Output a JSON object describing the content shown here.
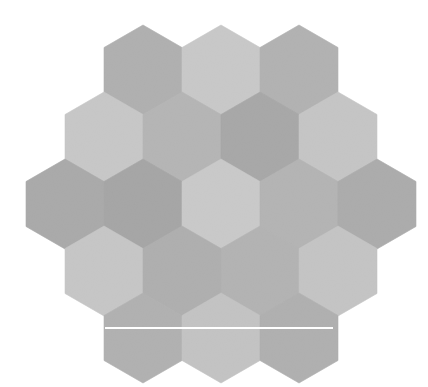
{
  "canvas": {
    "width": 428,
    "height": 387,
    "background": "#ffffff",
    "title": "hexagon-tiling-grayscale"
  },
  "palette": {
    "light": "#cfcfcf",
    "medium_light": "#c2c2c2",
    "medium": "#b4b4b4",
    "medium_dark": "#a9a9a9",
    "dark": "#9f9f9f",
    "line": "#ffffff",
    "background": "#ffffff"
  },
  "geometry": {
    "hex_width": 78,
    "hex_height": 90,
    "col_step": 78,
    "row_step": 67,
    "origin_x": 104,
    "origin_y": 25,
    "orientation": "pointy-top"
  },
  "rows": [
    {
      "index": 0,
      "count": 3,
      "cells": [
        {
          "id": "r0c0",
          "cx": 143,
          "cy": 70,
          "shade": "#b0b0b0"
        },
        {
          "id": "r0c1",
          "cx": 221,
          "cy": 70,
          "shade": "#cccccc"
        },
        {
          "id": "r0c2",
          "cx": 299,
          "cy": 70,
          "shade": "#b2b2b2"
        }
      ]
    },
    {
      "index": 1,
      "count": 4,
      "cells": [
        {
          "id": "r1c0",
          "cx": 104,
          "cy": 137,
          "shade": "#cbcbcb"
        },
        {
          "id": "r1c1",
          "cx": 182,
          "cy": 137,
          "shade": "#b6b6b6"
        },
        {
          "id": "r1c2",
          "cx": 260,
          "cy": 137,
          "shade": "#a6a6a6"
        },
        {
          "id": "r1c3",
          "cx": 338,
          "cy": 137,
          "shade": "#c9c9c9"
        }
      ]
    },
    {
      "index": 2,
      "count": 5,
      "cells": [
        {
          "id": "r2c0",
          "cx": 65,
          "cy": 204,
          "shade": "#a8a8a8"
        },
        {
          "id": "r2c1",
          "cx": 143,
          "cy": 204,
          "shade": "#a4a4a4"
        },
        {
          "id": "r2c2",
          "cx": 221,
          "cy": 204,
          "shade": "#cdcdcd"
        },
        {
          "id": "r2c3",
          "cx": 299,
          "cy": 204,
          "shade": "#b4b4b4"
        },
        {
          "id": "r2c4",
          "cx": 377,
          "cy": 204,
          "shade": "#ababab"
        }
      ]
    },
    {
      "index": 3,
      "count": 4,
      "cells": [
        {
          "id": "r3c0",
          "cx": 104,
          "cy": 271,
          "shade": "#cacaca"
        },
        {
          "id": "r3c1",
          "cx": 182,
          "cy": 271,
          "shade": "#aeaeae"
        },
        {
          "id": "r3c2",
          "cx": 260,
          "cy": 271,
          "shade": "#b3b3b3"
        },
        {
          "id": "r3c3",
          "cx": 338,
          "cy": 271,
          "shade": "#c7c7c7"
        }
      ]
    },
    {
      "index": 4,
      "count": 3,
      "cells": [
        {
          "id": "r4c0",
          "cx": 143,
          "cy": 338,
          "shade": "#b1b1b1"
        },
        {
          "id": "r4c1",
          "cx": 221,
          "cy": 338,
          "shade": "#c6c6c6"
        },
        {
          "id": "r4c2",
          "cx": 299,
          "cy": 338,
          "shade": "#b0b0b0"
        }
      ]
    }
  ],
  "overlay_line": {
    "name": "horizontal-guide-line",
    "x1": 105,
    "x2": 333,
    "y": 328,
    "thickness": 2,
    "color": "#ffffff"
  },
  "texture": {
    "type": "noise-grain",
    "opacity": 0.16,
    "description": "fine photographic grain over all tiles"
  }
}
